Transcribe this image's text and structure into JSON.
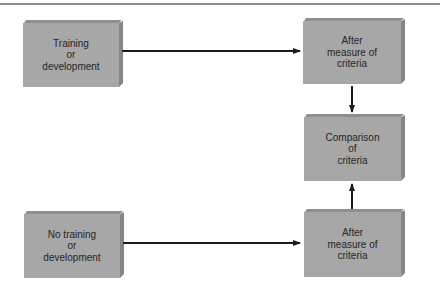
{
  "diagram": {
    "type": "flowchart",
    "colors": {
      "box_face": "#a7a7a7",
      "box_side": "#868686",
      "box_top": "#8f8f8f",
      "text": "#262626",
      "arrow": "#1a1a1a",
      "rule": "#8e8e8e"
    },
    "nodes": {
      "training": {
        "label": "Training\nor\ndevelopment"
      },
      "after_top": {
        "label": "After\nmeasure of\ncriteria"
      },
      "comparison": {
        "label": "Comparison\nof\ncriteria"
      },
      "no_training": {
        "label": "No training\nor\ndevelopment"
      },
      "after_bottom": {
        "label": "After\nmeasure of\ncriteria"
      }
    },
    "edges": [
      {
        "from": "training",
        "to": "after_top"
      },
      {
        "from": "after_top",
        "to": "comparison"
      },
      {
        "from": "no_training",
        "to": "after_bottom"
      },
      {
        "from": "after_bottom",
        "to": "comparison"
      }
    ]
  }
}
